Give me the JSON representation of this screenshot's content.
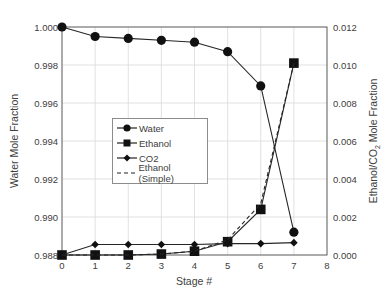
{
  "chart_data": {
    "type": "line",
    "title": "",
    "xlabel": "Stage #",
    "ylabel": "Water Mole Fraction",
    "y2label": "Ethanol/CO2 Mole Fraction",
    "x": [
      0,
      1,
      2,
      3,
      4,
      5,
      6,
      7
    ],
    "xlim": [
      0,
      8
    ],
    "xticks": [
      "0",
      "1",
      "2",
      "3",
      "4",
      "5",
      "6",
      "7",
      "8"
    ],
    "ylim": [
      0.988,
      1.0
    ],
    "yticks": [
      "0.988",
      "0.990",
      "0.992",
      "0.994",
      "0.996",
      "0.998",
      "1.000"
    ],
    "y2lim": [
      0.0,
      0.012
    ],
    "y2ticks": [
      "0.000",
      "0.002",
      "0.004",
      "0.006",
      "0.008",
      "0.010",
      "0.012"
    ],
    "grid": true,
    "legend_position": "center-left inside",
    "series": [
      {
        "name": "Water",
        "axis": "left",
        "marker": "circle",
        "style": "solid",
        "values": [
          1.0,
          0.9995,
          0.9994,
          0.9993,
          0.9992,
          0.9987,
          0.9969,
          0.9892
        ]
      },
      {
        "name": "Ethanol",
        "axis": "right",
        "marker": "square",
        "style": "solid",
        "values": [
          0.0,
          0.0,
          0.0,
          5e-05,
          0.0002,
          0.0007,
          0.0024,
          0.0101
        ]
      },
      {
        "name": "CO2",
        "axis": "right",
        "marker": "diamond",
        "style": "solid",
        "values": [
          0.0,
          0.00055,
          0.00055,
          0.00055,
          0.00055,
          0.0006,
          0.0006,
          0.00065
        ]
      },
      {
        "name": "Ethanol (Simple)",
        "axis": "right",
        "marker": "none",
        "style": "dashed",
        "values": [
          0.0,
          0.0,
          0.0,
          5e-05,
          0.0002,
          0.0008,
          0.0027,
          0.0101
        ]
      }
    ]
  },
  "legend": {
    "items": [
      "Water",
      "Ethanol",
      "CO2",
      "Ethanol (Simple)"
    ]
  },
  "axes": {
    "xlabel": "Stage #",
    "ylabel": "Water Mole Fraction",
    "y2label_main": "Ethanol/CO",
    "y2label_sub": "2",
    "y2label_tail": " Mole Fraction"
  }
}
